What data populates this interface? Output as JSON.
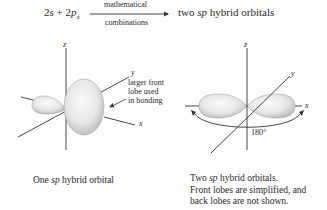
{
  "equation": {
    "lhs_term1_coef": "2",
    "lhs_term1_orbital": "s",
    "plus": "+",
    "lhs_term2_coef": "2",
    "lhs_term2_orbital": "p",
    "lhs_term2_subscript": "x",
    "arrow_label_top": "mathematical",
    "arrow_label_bottom": "combinations",
    "rhs_prefix": "two",
    "rhs_italic": "sp",
    "rhs_suffix": "hybrid orbitals"
  },
  "left_figure": {
    "axis_labels": {
      "z": "z",
      "y": "y",
      "x": "x"
    },
    "annotation_lines": [
      "larger front",
      "lobe used",
      "in bonding"
    ],
    "caption_prefix": "One",
    "caption_italic": "sp",
    "caption_suffix": "hybrid orbital"
  },
  "right_figure": {
    "axis_labels": {
      "z": "z",
      "y": "y",
      "x": "x"
    },
    "angle_label": "180°",
    "caption_line1_prefix": "Two",
    "caption_line1_italic": "sp",
    "caption_line1_suffix": "hybrid orbitals.",
    "caption_line2": "Front lobes are simplified, and",
    "caption_line3": "back lobes are not shown."
  },
  "colors": {
    "line": "#3a3a3a",
    "lobe_fill_light": "#f4f4f4",
    "lobe_fill_dark": "#bdbdbd",
    "text": "#2a2a2a"
  }
}
